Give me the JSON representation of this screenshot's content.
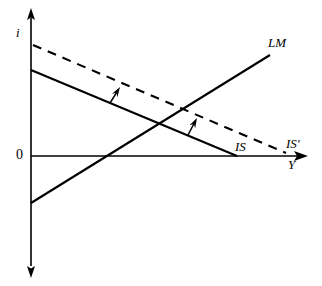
{
  "figure": {
    "background_color": "#ffffff",
    "line_color": "#000000",
    "axes": {
      "vertical_axis_label": "i",
      "horizontal_axis_label": "Y",
      "origin_label": "0"
    },
    "curves": [
      {
        "id": "is",
        "label": "IS",
        "style": "solid",
        "slope": "downward"
      },
      {
        "id": "isp",
        "label": "IS'",
        "style": "dashed",
        "slope": "downward"
      },
      {
        "id": "lm",
        "label": "LM",
        "style": "solid",
        "slope": "upward"
      }
    ],
    "annotations": [
      {
        "id": "shift-arrow-1",
        "icon": "up-right-arrow-icon",
        "meaning": "IS shifts right"
      },
      {
        "id": "shift-arrow-2",
        "icon": "up-right-arrow-icon",
        "meaning": "IS shifts right"
      }
    ]
  },
  "chart_data": {
    "type": "line",
    "title": "",
    "xlabel": "Y",
    "ylabel": "i",
    "origin_label": "0",
    "grid": false,
    "legend": "inline-curve-labels",
    "xlim": [
      0,
      307
    ],
    "ylim": [
      -116,
      143
    ],
    "axes_pixels": {
      "y_axis_x": 31,
      "x_axis_y": 156,
      "y_axis_top": 13,
      "y_axis_bottom": 272,
      "x_axis_right": 307
    },
    "series": [
      {
        "name": "IS",
        "style": "solid",
        "label": "IS",
        "label_pos": [
          235,
          140
        ],
        "points": [
          [
            31,
            70
          ],
          [
            237,
            156
          ]
        ]
      },
      {
        "name": "IS'",
        "style": "dashed",
        "label": "IS'",
        "label_pos": [
          286,
          137
        ],
        "points": [
          [
            33,
            45
          ],
          [
            286,
            153
          ]
        ]
      },
      {
        "name": "LM",
        "style": "solid",
        "label": "LM",
        "label_pos": [
          268,
          36
        ],
        "points": [
          [
            31,
            203
          ],
          [
            270,
            55
          ]
        ]
      }
    ],
    "annotation_arrows": [
      {
        "from": [
          110,
          103
        ],
        "to": [
          120,
          87
        ]
      },
      {
        "from": [
          188,
          135
        ],
        "to": [
          197,
          118
        ]
      }
    ],
    "intersections": [
      {
        "curves": [
          "IS",
          "LM"
        ],
        "point": [
          168,
          118
        ]
      },
      {
        "curves": [
          "IS'",
          "LM"
        ],
        "point": [
          203,
          96
        ]
      }
    ]
  }
}
